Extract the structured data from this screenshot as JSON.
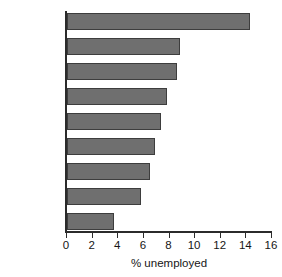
{
  "chart_data": {
    "type": "bar",
    "orientation": "horizontal",
    "title": "",
    "xlabel": "% unemployed",
    "ylabel": "",
    "categories": [
      "Spain",
      "France",
      "Poland",
      "Germany",
      "Sweden",
      "Italy",
      "UK",
      "Czech Rep.",
      "Netherlands"
    ],
    "values": [
      14.3,
      8.8,
      8.6,
      7.8,
      7.3,
      6.9,
      6.5,
      5.8,
      3.7
    ],
    "xlim": [
      0,
      16
    ],
    "xticks": [
      0,
      2,
      4,
      6,
      8,
      10,
      12,
      14,
      16
    ],
    "xtick_labels": [
      "0",
      "2",
      "4",
      "6",
      "8",
      "10",
      "12",
      "14",
      "16"
    ],
    "grid": false,
    "legend": null,
    "bar_color": "#6f6f6f",
    "bar_edge_color": "#3d3d3d",
    "axis_color": "#2b2b2b"
  }
}
